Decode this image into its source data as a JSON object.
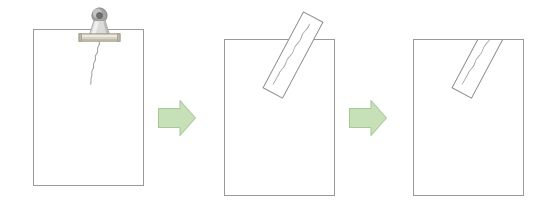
{
  "figure": {
    "type": "process-sequence",
    "background_color": "#ffffff",
    "panel_count": 3,
    "arrow_count": 2
  },
  "colors": {
    "background": "#ffffff",
    "paper_fill": "#ffffff",
    "paper_stroke": "#9a9a9a",
    "strip_fill": "#ffffff",
    "strip_stroke": "#8c8c8c",
    "squiggle_stroke": "#a0a0a0",
    "arrow_fill": "#c8e0b8",
    "arrow_stroke": "#a9c99a",
    "clip_ring_outer": "#9b9b9b",
    "clip_ring_inner": "#6f6f6f",
    "clip_body_light": "#e4e4e2",
    "clip_body_mid": "#bdbdbb",
    "clip_bar_fill": "#d8d2c4",
    "clip_bar_stroke": "#9c9686"
  },
  "panels": [
    {
      "index": 1,
      "name": "panel-clip-and-wire",
      "paper": {
        "x": 33,
        "y": 29,
        "width": 110,
        "height": 156
      },
      "has_clip": true,
      "has_wire": true,
      "has_strip": false,
      "clip": {
        "name": "binder-clip",
        "bar": {
          "x": 79,
          "y": 34,
          "width": 41,
          "height": 7
        },
        "ring": {
          "cx": 99.5,
          "cy": 15.5,
          "r_outer": 7.5,
          "r_inner": 3.2
        }
      },
      "wire": {
        "name": "squiggly-wire",
        "start": {
          "x": 99,
          "y": 41
        },
        "end": {
          "x": 91,
          "y": 84
        }
      }
    },
    {
      "index": 2,
      "name": "panel-strip-overhanging",
      "paper": {
        "x": 224,
        "y": 39,
        "width": 110,
        "height": 156
      },
      "has_clip": false,
      "has_wire": false,
      "has_strip": true,
      "strip": {
        "name": "tilted-strip",
        "rotation_deg": 28,
        "clipped_to_paper": false,
        "overhangs_top_edge": true,
        "has_inner_squiggle": true
      }
    },
    {
      "index": 3,
      "name": "panel-strip-trimmed",
      "paper": {
        "x": 413,
        "y": 39,
        "width": 110,
        "height": 156
      },
      "has_clip": false,
      "has_wire": false,
      "has_strip": true,
      "strip": {
        "name": "tilted-strip",
        "rotation_deg": 28,
        "clipped_to_paper": true,
        "overhangs_top_edge": false,
        "has_inner_squiggle": true
      }
    }
  ],
  "arrows": [
    {
      "index": 1,
      "name": "process-arrow-1",
      "direction": "right",
      "x": 157,
      "y": 100,
      "width": 40,
      "height": 36
    },
    {
      "index": 2,
      "name": "process-arrow-2",
      "direction": "right",
      "x": 348,
      "y": 100,
      "width": 40,
      "height": 36
    }
  ]
}
